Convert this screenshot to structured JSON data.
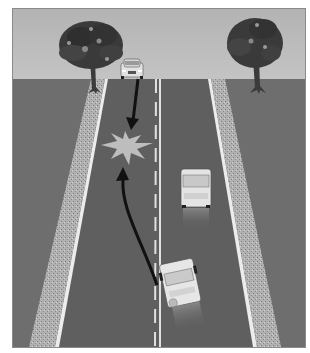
{
  "figure": {
    "type": "illustration",
    "elements": {
      "trees": 2,
      "cars": 3,
      "arrows": 2,
      "impact_marker": "starburst"
    },
    "colors": {
      "sky": "#b9b9b9",
      "ground": "#6e6e6e",
      "road": "#5f5f5f",
      "shoulder": "#a9a9a9",
      "lane_line": "#e8e8e8",
      "car_body": "#e4e4e4",
      "arrow": "#111111",
      "impact": "#bdbdbd",
      "foliage": "#3a3a3a"
    }
  }
}
